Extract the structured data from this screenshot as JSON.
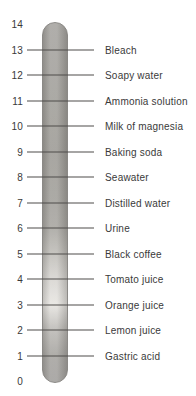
{
  "figure": {
    "type": "ph-scale-diagram",
    "axis_max": "14",
    "axis_min": "0",
    "entries": [
      {
        "ph": "13",
        "label": "Bleach"
      },
      {
        "ph": "12",
        "label": "Soapy water"
      },
      {
        "ph": "11",
        "label": "Ammonia solution"
      },
      {
        "ph": "10",
        "label": "Milk of magnesia"
      },
      {
        "ph": "9",
        "label": "Baking soda"
      },
      {
        "ph": "8",
        "label": "Seawater"
      },
      {
        "ph": "7",
        "label": "Distilled water"
      },
      {
        "ph": "6",
        "label": "Urine"
      },
      {
        "ph": "5",
        "label": "Black coffee"
      },
      {
        "ph": "4",
        "label": "Tomato juice"
      },
      {
        "ph": "3",
        "label": "Orange juice"
      },
      {
        "ph": "2",
        "label": "Lemon juice"
      },
      {
        "ph": "1",
        "label": "Gastric acid"
      }
    ],
    "colors": {
      "background": "#ffffff",
      "text": "#3a3a3a",
      "tick_line": "#4e4c4a",
      "bar_border": "#8b8986",
      "bar_gradient": [
        {
          "ph": 14,
          "hex": "#a7a5a1"
        },
        {
          "ph": 11,
          "hex": "#a2a09b"
        },
        {
          "ph": 9,
          "hex": "#9e9c97"
        },
        {
          "ph": 7,
          "hex": "#a3a19c"
        },
        {
          "ph": 6,
          "hex": "#a9a7a2"
        },
        {
          "ph": 5,
          "hex": "#bfbdb8"
        },
        {
          "ph": 4,
          "hex": "#d7d5d1"
        },
        {
          "ph": 3,
          "hex": "#e7e5e1"
        },
        {
          "ph": 2,
          "hex": "#bdbbb7"
        },
        {
          "ph": 1,
          "hex": "#a7a5a1"
        },
        {
          "ph": 0,
          "hex": "#a3a19e"
        }
      ]
    }
  }
}
